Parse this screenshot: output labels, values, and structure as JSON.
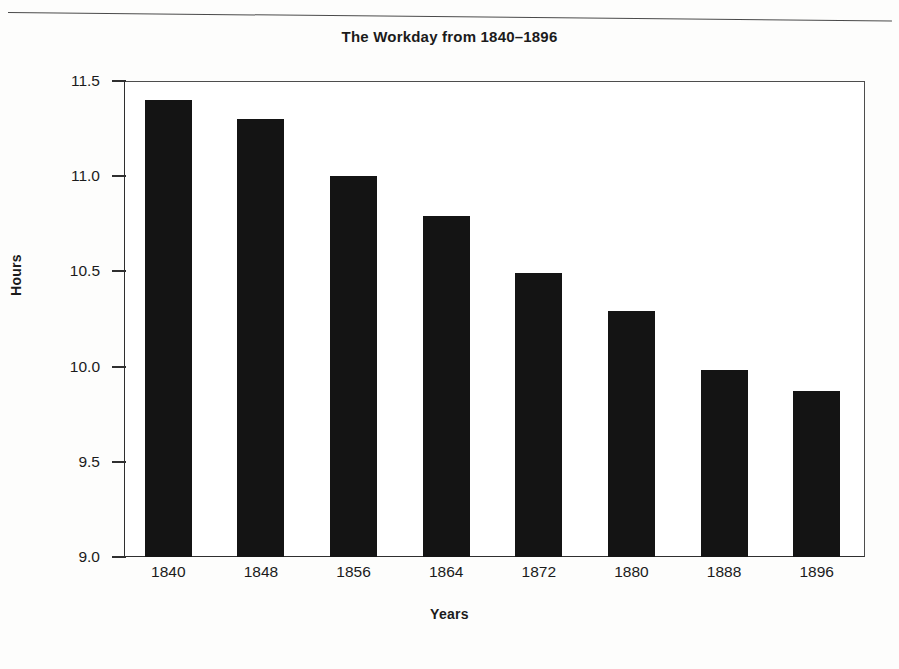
{
  "page": {
    "background_color": "#fdfdfc",
    "rule_color": "#4a4a4a"
  },
  "chart_data": {
    "type": "bar",
    "title": "The Workday from 1840–1896",
    "xlabel": "Years",
    "ylabel": "Hours",
    "categories": [
      "1840",
      "1848",
      "1856",
      "1864",
      "1872",
      "1880",
      "1888",
      "1896"
    ],
    "values": [
      11.4,
      11.3,
      11.0,
      10.79,
      10.49,
      10.29,
      9.98,
      9.87
    ],
    "ylim": [
      9.0,
      11.5
    ],
    "yticks": [
      9.0,
      9.5,
      10.0,
      10.5,
      11.0,
      11.5
    ],
    "ytick_labels": [
      "9.0",
      "9.5",
      "10.0",
      "10.5",
      "11.0",
      "11.5"
    ],
    "grid": false,
    "legend": false,
    "bar_color": "#141414",
    "axis_color": "#2f2f2f"
  }
}
